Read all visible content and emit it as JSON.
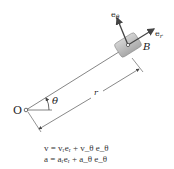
{
  "diagram": {
    "origin_label": "O",
    "point_label": "B",
    "angle_label": "θ",
    "distance_label": "r",
    "unit_vectors": {
      "radial": "e",
      "radial_sub": "r",
      "transverse": "e",
      "transverse_sub": "θ"
    },
    "equations": [
      "v = vᵣeᵣ + v_θ e_θ",
      "a = aᵣeᵣ + a_θ e_θ"
    ],
    "colors": {
      "line": "#555555",
      "vector": "#444444",
      "block_fill": "#b8b8b8",
      "block_edge": "#8a8a8a",
      "text": "#222222"
    }
  }
}
